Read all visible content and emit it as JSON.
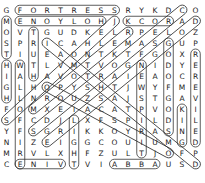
{
  "puzzle": {
    "rows": [
      "GFORTRESSRYKDCO",
      "MENOYLOHJKCORAD",
      "OVTGUDKELRPELOZ",
      "SPRICAHLEMASGUP",
      "TIUEAONTKTFGOXR",
      "HWTLVMTVOGNIDYE",
      "IAHAVOTRAIEAOCR",
      "GLHQPYSHTJWYFME",
      "HLNROUZSAJSTGAV",
      "FOMXEIACATPVOKI",
      "SFCDJLXFSPILDIL",
      "YFSGRIKKOYRASNE",
      "NIZEIGGCOUIUMGD",
      "MRVLXHFZULTJOFP",
      "CENIVTVIABBAUSD"
    ],
    "found_words": [
      {
        "word": "FORTRESS",
        "r1": 0,
        "c1": 1,
        "r2": 0,
        "c2": 8
      },
      {
        "word": "HOLYONE",
        "r1": 1,
        "c1": 1,
        "r2": 1,
        "c2": 7
      },
      {
        "word": "ROCK",
        "r1": 1,
        "c1": 9,
        "r2": 1,
        "c2": 12
      },
      {
        "word": "MOST",
        "r1": 1,
        "c1": 0,
        "r2": 4,
        "c2": 0
      },
      {
        "word": "HIGH",
        "r1": 5,
        "c1": 0,
        "r2": 8,
        "c2": 0
      },
      {
        "word": "TRUTH",
        "r1": 2,
        "c1": 2,
        "r2": 6,
        "c2": 2
      },
      {
        "word": "WALLOFFIRE",
        "r1": 5,
        "c1": 1,
        "r2": 14,
        "c2": 1
      },
      {
        "word": "GODOFGODS",
        "r1": 3,
        "c1": 12,
        "r2": 11,
        "c2": 12
      },
      {
        "word": "NEWSPIRIT",
        "r1": 5,
        "c1": 10,
        "r2": 13,
        "c2": 10
      },
      {
        "word": "KING",
        "r1": 9,
        "c1": 13,
        "r2": 12,
        "c2": 13
      },
      {
        "word": "DELIVERER",
        "r1": 4,
        "c1": 14,
        "r2": 12,
        "c2": 14
      },
      {
        "word": "LIGHT",
        "r1": 10,
        "c1": 5,
        "r2": 14,
        "c2": 5
      },
      {
        "word": "VINE",
        "r1": 14,
        "c1": 1,
        "r2": 14,
        "c2": 4
      },
      {
        "word": "ABBA",
        "r1": 14,
        "c1": 8,
        "r2": 14,
        "c2": 11
      }
    ],
    "diagonal_words": [
      {
        "r1": 0,
        "c1": 13,
        "r2": 11,
        "c2": 2
      },
      {
        "r1": 1,
        "c1": 14,
        "r2": 12,
        "c2": 3
      },
      {
        "r1": 1,
        "c1": 8,
        "r2": 10,
        "c2": 0
      },
      {
        "r1": 2,
        "c1": 9,
        "r2": 9,
        "c2": 2
      },
      {
        "r1": 3,
        "c1": 3,
        "r2": 14,
        "c2": 14
      },
      {
        "r1": 7,
        "c1": 3,
        "r2": 13,
        "c2": 12
      }
    ]
  }
}
